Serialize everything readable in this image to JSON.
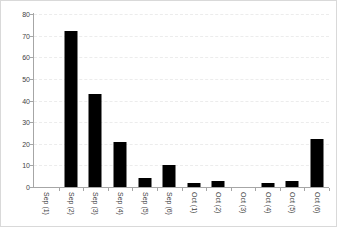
{
  "chart_data": {
    "type": "bar",
    "title": "",
    "subtitle": "",
    "xlabel": "",
    "ylabel": "",
    "categories": [
      "Sep (1)",
      "Sep (2)",
      "Sep (3)",
      "Sep (4)",
      "Sep (5)",
      "Sep (6)",
      "Oct (1)",
      "Oct (2)",
      "Oct (3)",
      "Oct (4)",
      "Oct (5)",
      "Oct (6)"
    ],
    "values": [
      0,
      72,
      43,
      21,
      4,
      10,
      2,
      3,
      0,
      2,
      3,
      22
    ],
    "ylim": [
      0,
      80
    ],
    "yticks": [
      0,
      10,
      20,
      30,
      40,
      50,
      60,
      70,
      80
    ],
    "ytick_labels": [
      "0",
      "10",
      "20",
      "30",
      "40",
      "50",
      "60",
      "70",
      "80"
    ],
    "grid": true,
    "grid_axis": "y",
    "grid_style": "dashed",
    "legend": false,
    "legend_position": "none",
    "bar_color": "#000000",
    "grid_color": "#ececec",
    "axis_color": "#a6a6a6",
    "background_color": "#ffffff",
    "border_color": "#d9d9d9",
    "tick_label_color": "#3f3f3f",
    "xtick_label_rotation": 90
  }
}
